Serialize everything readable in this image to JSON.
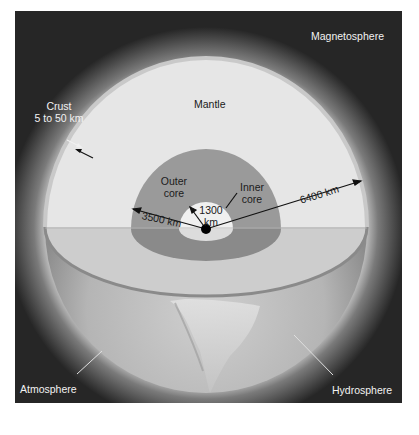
{
  "diagram": {
    "labels": {
      "magnetosphere": "Magnetosphere",
      "mantle": "Mantle",
      "crust_line1": "Crust",
      "crust_line2": "5 to 50 km",
      "outer_core_line1": "Outer",
      "outer_core_line2": "core",
      "inner_core_line1": "Inner",
      "inner_core_line2": "core",
      "radius_inner": "1300",
      "radius_inner_unit": "km",
      "radius_outer_core": "3500 km",
      "radius_earth": "6400 km",
      "atmosphere": "Atmosphere",
      "hydrosphere": "Hydrosphere"
    },
    "colors": {
      "background": "#262626",
      "mantle": "#e6e6e6",
      "outer_core": "#9a9a9a",
      "inner_core": "#f0f0f0",
      "crust_rim": "#8a8a8a",
      "center_dot": "#000000"
    },
    "geometry": {
      "earth_radius_px": 161,
      "outer_core_radius_px": 75,
      "inner_core_radius_px": 27
    }
  }
}
